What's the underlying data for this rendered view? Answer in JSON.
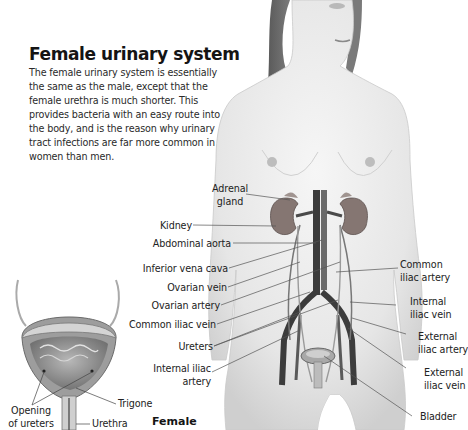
{
  "header": {
    "title": "Female urinary system",
    "intro": "The female urinary system is essentially the same as the male, except that the female urethra is much shorter. This provides bacteria with an easy route into the body, and is the reason why urinary tract infections are far more common in women than men."
  },
  "figure_main": {
    "left_labels": [
      {
        "id": "adrenal",
        "text": "Adrenal\ngland"
      },
      {
        "id": "kidney",
        "text": "Kidney"
      },
      {
        "id": "abdominal_aorta",
        "text": "Abdominal aorta"
      },
      {
        "id": "inferior_vena_cava",
        "text": "Inferior vena cava"
      },
      {
        "id": "ovarian_vein",
        "text": "Ovarian vein"
      },
      {
        "id": "ovarian_artery",
        "text": "Ovarian artery"
      },
      {
        "id": "common_iliac_vein",
        "text": "Common iliac vein"
      },
      {
        "id": "ureters",
        "text": "Ureters"
      },
      {
        "id": "internal_iliac_artery",
        "text": "Internal iliac\nartery"
      }
    ],
    "right_labels": [
      {
        "id": "common_iliac_artery",
        "text": "Common\niliac artery"
      },
      {
        "id": "internal_iliac_vein",
        "text": "Internal\niliac vein"
      },
      {
        "id": "external_iliac_artery",
        "text": "External\niliac artery"
      },
      {
        "id": "external_iliac_vein",
        "text": "External\niliac vein"
      },
      {
        "id": "bladder",
        "text": "Bladder"
      }
    ],
    "caption": "Female"
  },
  "figure_bladder": {
    "labels": {
      "trigone": "Trigone",
      "opening": "Opening\nof ureters",
      "urethra": "Urethra"
    }
  },
  "colors": {
    "skin": "#ececec",
    "kidney": "#8a7c78",
    "vessel_dark": "#4a4a4a",
    "leader": "#555555"
  }
}
